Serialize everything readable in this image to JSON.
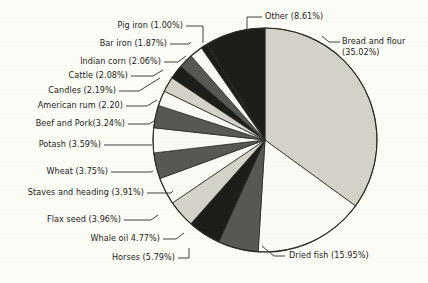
{
  "figure": {
    "background_color": "#fdfdf7",
    "text_color": "#1b1b19",
    "outline_color": "#2b2b28"
  },
  "chart_data": {
    "type": "pie",
    "title": "",
    "subtitle": "",
    "xlabel": "",
    "ylabel": "",
    "legend_position": "none",
    "grid": false,
    "start_angle_deg": 0,
    "direction": "clockwise",
    "center": [
      265,
      140
    ],
    "radius": 112,
    "categories": [
      "Bread and flour",
      "Dried fish",
      "Horses",
      "Whale oil",
      "Flax seed",
      "Staves and heading",
      "Wheat",
      "Potash",
      "Beef and Pork",
      "American rum",
      "Candles",
      "Cattle",
      "Indian corn",
      "Bar iron",
      "Pig iron",
      "Other"
    ],
    "values": [
      35.02,
      15.95,
      5.79,
      4.77,
      3.96,
      3.91,
      3.75,
      3.59,
      3.24,
      2.2,
      2.19,
      2.08,
      2.06,
      1.87,
      1.0,
      8.61
    ],
    "units": "percent",
    "slice_fills": [
      "#d4d2c9",
      "#fbfbf5",
      "#585751",
      "#1c1c19",
      "#d4d2c9",
      "#fbfbf5",
      "#585751",
      "#fbfbf5",
      "#585751",
      "#fbfbf5",
      "#d4d2c9",
      "#1c1c19",
      "#585751",
      "#fbfbf5",
      "#1c1c19",
      "#1c1c19"
    ],
    "labels": [
      {
        "key": "bread-and-flour",
        "text_line1": "Bread and flour",
        "text_line2": "(35.02%)",
        "display": "Bread and flour (35.02%)"
      },
      {
        "key": "dried-fish",
        "display": "Dried fish (15.95%)"
      },
      {
        "key": "horses",
        "display": "Horses (5.79%)"
      },
      {
        "key": "whale-oil",
        "display": "Whale oil 4.77%)"
      },
      {
        "key": "flax-seed",
        "display": "Flax seed (3.96%)"
      },
      {
        "key": "staves-and-heading",
        "display": "Staves and heading (3.91%)"
      },
      {
        "key": "wheat",
        "display": "Wheat (3.75%)"
      },
      {
        "key": "potash",
        "display": "Potash (3.59%)"
      },
      {
        "key": "beef-and-pork",
        "display": "Beef and Pork(3.24%)"
      },
      {
        "key": "american-rum",
        "display": "American rum (2.20)"
      },
      {
        "key": "candles",
        "display": "Candles (2.19%)"
      },
      {
        "key": "cattle",
        "display": "Cattle (2.08%)"
      },
      {
        "key": "indian-corn",
        "display": "Indian corn (2.06%)"
      },
      {
        "key": "bar-iron",
        "display": "Bar iron (1.87%)"
      },
      {
        "key": "pig-iron",
        "display": "Pig iron (1.00%)"
      },
      {
        "key": "other",
        "display": "Other (8.61%)"
      }
    ]
  }
}
